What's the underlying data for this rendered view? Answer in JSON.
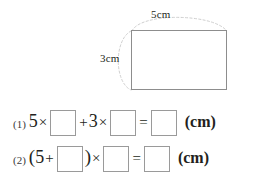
{
  "figure": {
    "shape_name": "rectangle",
    "width_label": "5cm",
    "height_label": "3cm",
    "arc_style": "dashed-bracket"
  },
  "equations": [
    {
      "number": "(1)",
      "tokens": [
        {
          "kind": "term",
          "text": "5"
        },
        {
          "kind": "op",
          "text": "×"
        },
        {
          "kind": "box",
          "value": ""
        },
        {
          "kind": "op",
          "text": "+"
        },
        {
          "kind": "term",
          "text": "3"
        },
        {
          "kind": "op",
          "text": "×"
        },
        {
          "kind": "box",
          "value": ""
        },
        {
          "kind": "op",
          "text": "="
        },
        {
          "kind": "box",
          "value": ""
        },
        {
          "kind": "unit",
          "text": "(cm)"
        }
      ]
    },
    {
      "number": "(2)",
      "tokens": [
        {
          "kind": "paren",
          "text": "("
        },
        {
          "kind": "term",
          "text": "5"
        },
        {
          "kind": "op",
          "text": "+"
        },
        {
          "kind": "box",
          "value": ""
        },
        {
          "kind": "paren",
          "text": ")"
        },
        {
          "kind": "op",
          "text": "×"
        },
        {
          "kind": "box",
          "value": ""
        },
        {
          "kind": "op",
          "text": "="
        },
        {
          "kind": "box",
          "value": ""
        },
        {
          "kind": "unit",
          "text": "(cm)"
        }
      ]
    }
  ],
  "colors": {
    "ink": "#231f20",
    "rect_border": "#8d8d8d",
    "arc": "#cfcfcf",
    "box_border": "#9a9a9a",
    "background": "#ffffff"
  }
}
